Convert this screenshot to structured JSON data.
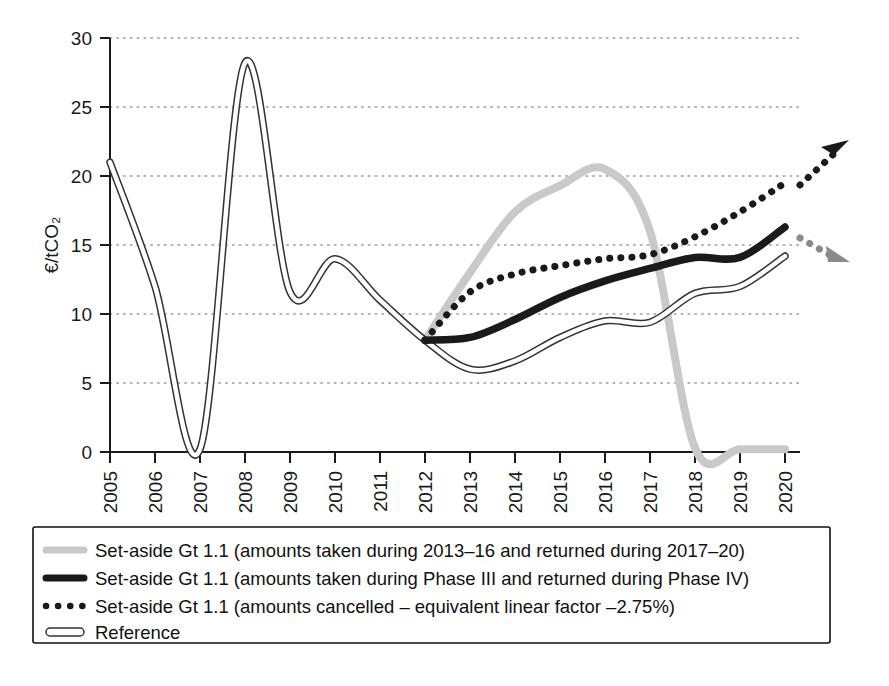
{
  "chart_data": {
    "type": "line",
    "title": "",
    "xlabel": "",
    "ylabel": "€/tCO₂",
    "xlim": [
      2005,
      2020
    ],
    "ylim": [
      0,
      30
    ],
    "yticks": [
      0,
      5,
      10,
      15,
      20,
      25,
      30
    ],
    "ytick_labels": [
      "0",
      "5",
      "10",
      "15",
      "20",
      "25",
      "30"
    ],
    "grid": "horizontal-dotted",
    "legend_position": "below-plot",
    "categories": [
      2005,
      2006,
      2007,
      2008,
      2009,
      2010,
      2011,
      2012,
      2013,
      2014,
      2015,
      2016,
      2017,
      2018,
      2019,
      2020
    ],
    "xtick_labels": [
      "2005",
      "2006",
      "2007",
      "2008",
      "2009",
      "2010",
      "2011",
      "2012",
      "2013",
      "2014",
      "2015",
      "2016",
      "2017",
      "2018",
      "2019",
      "2020"
    ],
    "series": [
      {
        "name": "Set-aside Gt 1.1 (amounts taken during 2013–16 and returned during 2017–20)",
        "style": "solid-thick",
        "color": "#c9c9c9",
        "values": [
          null,
          null,
          null,
          null,
          null,
          null,
          null,
          8.1,
          13.0,
          17.4,
          19.3,
          20.5,
          16.0,
          0.3,
          0.2,
          0.2
        ],
        "arrow": false
      },
      {
        "name": "Set-aside Gt 1.1 (amounts taken during Phase III and returned during Phase IV)",
        "style": "solid-thick",
        "color": "#1a1a1a",
        "values": [
          null,
          null,
          null,
          null,
          null,
          null,
          null,
          8.1,
          8.3,
          9.6,
          11.2,
          12.4,
          13.3,
          14.1,
          14.1,
          16.3
        ],
        "arrow": "down-right-gray"
      },
      {
        "name": "Set-aside Gt 1.1 (amounts cancelled – equivalent linear factor –2.75%)",
        "style": "dotted-thick",
        "color": "#1a1a1a",
        "values": [
          null,
          null,
          null,
          null,
          null,
          null,
          null,
          8.1,
          11.6,
          12.9,
          13.5,
          14.0,
          14.3,
          15.6,
          17.4,
          19.5
        ],
        "arrow": "up-right-black"
      },
      {
        "name": "Reference",
        "style": "double-outline",
        "color": "#ffffff",
        "values": [
          21.0,
          12.0,
          0.2,
          28.2,
          11.6,
          14.0,
          11.0,
          8.1,
          6.0,
          6.6,
          8.3,
          9.5,
          9.4,
          11.5,
          12.0,
          14.2
        ],
        "arrow": false
      }
    ]
  },
  "legend": {
    "items": [
      {
        "label": "Set-aside Gt 1.1 (amounts taken during 2013–16 and returned during 2017–20)",
        "swatch": "light-gray-line"
      },
      {
        "label": "Set-aside Gt 1.1 (amounts taken during Phase III and returned during Phase IV)",
        "swatch": "black-line"
      },
      {
        "label": "Set-aside Gt 1.1 (amounts cancelled – equivalent linear factor –2.75%)",
        "swatch": "black-dots"
      },
      {
        "label": "Reference",
        "swatch": "outlined-white-line"
      }
    ]
  },
  "colors": {
    "set_aside_return": "#c9c9c9",
    "set_aside_phase": "#1a1a1a",
    "set_aside_cancel": "#1a1a1a",
    "reference_fill": "#ffffff",
    "reference_stroke": "#333333",
    "axis": "#1a1a1a",
    "grid": "#9a9a9a"
  }
}
